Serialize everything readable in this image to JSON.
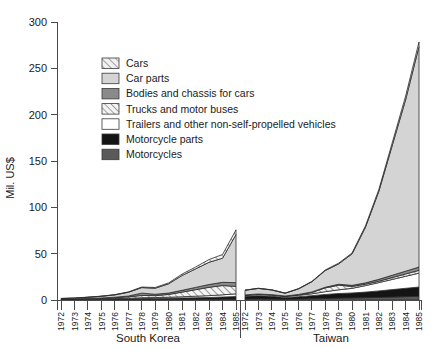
{
  "chart_data": {
    "type": "area",
    "title": "",
    "subtitle": "",
    "xlabel": "",
    "ylabel": "Mil. US$",
    "ylim": [
      0,
      300
    ],
    "yticks": [
      0,
      50,
      100,
      150,
      200,
      250,
      300
    ],
    "ytick_labels": [
      "0",
      "50",
      "100",
      "150",
      "200",
      "250",
      "300"
    ],
    "grid": false,
    "legend_position": "upper-left-inside",
    "stacked": true,
    "panels": [
      {
        "name": "South Korea",
        "label": "South Korea",
        "x": [
          1972,
          1973,
          1974,
          1975,
          1976,
          1977,
          1978,
          1979,
          1980,
          1981,
          1982,
          1983,
          1984,
          1985
        ],
        "xtick_labels": [
          "1972",
          "1973",
          "1974",
          "1975",
          "1976",
          "1977",
          "1978",
          "1979",
          "1980",
          "1981",
          "1982",
          "1983",
          "1984",
          "1985"
        ],
        "series": [
          {
            "name": "Motorcycles",
            "values": [
              0.2,
              0.2,
              0.3,
              0.3,
              0.4,
              0.4,
              0.5,
              0.5,
              0.5,
              0.6,
              0.6,
              0.7,
              0.8,
              0.9
            ]
          },
          {
            "name": "Motorcycle parts",
            "values": [
              0.3,
              0.3,
              0.4,
              0.5,
              0.6,
              0.8,
              1.0,
              1.2,
              1.3,
              1.5,
              1.8,
              2.0,
              2.4,
              2.8
            ]
          },
          {
            "name": "Trailers and other non-self-propelled vehicles",
            "values": [
              0.2,
              0.2,
              0.3,
              0.4,
              0.5,
              0.7,
              0.9,
              1.0,
              1.2,
              1.4,
              1.7,
              2.0,
              2.4,
              3.0
            ]
          },
          {
            "name": "Trucks and motor buses",
            "values": [
              0.2,
              0.3,
              0.4,
              0.6,
              0.9,
              1.5,
              2.5,
              2.0,
              3.0,
              5.0,
              7.0,
              9.0,
              10.0,
              8.0
            ]
          },
          {
            "name": "Bodies and chassis for cars",
            "values": [
              0.2,
              0.2,
              0.3,
              0.4,
              0.6,
              0.9,
              2.5,
              1.5,
              1.5,
              2.0,
              2.5,
              3.0,
              3.5,
              4.0
            ]
          },
          {
            "name": "Car parts",
            "values": [
              0.5,
              0.8,
              1.2,
              1.8,
              2.5,
              4.0,
              6.0,
              6.5,
              10.0,
              16.0,
              20.0,
              24.0,
              26.0,
              52.0
            ]
          },
          {
            "name": "Cars",
            "values": [
              0.1,
              0.1,
              0.2,
              0.2,
              0.3,
              0.4,
              0.6,
              0.8,
              1.0,
              1.5,
              2.0,
              3.0,
              4.0,
              5.0
            ]
          }
        ],
        "totals": [
          1.7,
          2.1,
          3.1,
          4.2,
          5.8,
          8.7,
          14.0,
          13.5,
          18.5,
          28.0,
          35.6,
          43.7,
          49.1,
          75.7
        ],
        "peak": {
          "year": 1985,
          "value": 75.7
        }
      },
      {
        "name": "Taiwan",
        "label": "Taiwan",
        "x": [
          1972,
          1973,
          1974,
          1975,
          1976,
          1977,
          1978,
          1979,
          1980,
          1981,
          1982,
          1983,
          1984,
          1985
        ],
        "xtick_labels": [
          "1972",
          "1973",
          "1974",
          "1975",
          "1976",
          "1977",
          "1978",
          "1979",
          "1980",
          "1981",
          "1982",
          "1983",
          "1984",
          "1985"
        ],
        "series": [
          {
            "name": "Motorcycles",
            "values": [
              1.0,
              1.2,
              1.0,
              0.8,
              1.0,
              1.3,
              1.6,
              2.0,
              2.2,
              2.5,
              2.8,
              3.2,
              3.6,
              4.0
            ]
          },
          {
            "name": "Motorcycle parts",
            "values": [
              3.0,
              3.5,
              3.0,
              2.0,
              2.6,
              3.4,
              4.4,
              5.0,
              5.4,
              6.0,
              7.0,
              8.0,
              9.0,
              10.0
            ]
          },
          {
            "name": "Trailers and other non-self-propelled vehicles",
            "values": [
              1.0,
              1.2,
              1.2,
              1.0,
              1.5,
              2.0,
              3.0,
              4.0,
              5.0,
              7.0,
              9.0,
              11.0,
              13.0,
              15.0
            ]
          },
          {
            "name": "Trucks and motor buses",
            "values": [
              0.3,
              0.4,
              0.4,
              0.3,
              0.6,
              1.5,
              4.0,
              5.0,
              2.0,
              1.5,
              1.5,
              2.0,
              2.5,
              3.0
            ]
          },
          {
            "name": "Bodies and chassis for cars",
            "values": [
              0.2,
              0.2,
              0.2,
              0.2,
              0.3,
              0.5,
              0.8,
              1.0,
              1.2,
              1.5,
              2.0,
              2.5,
              3.0,
              3.5
            ]
          },
          {
            "name": "Car parts",
            "values": [
              5.0,
              6.0,
              5.0,
              3.0,
              6.0,
              11.0,
              18.0,
              22.0,
              34.0,
              60.0,
              95.0,
              140.0,
              185.0,
              238.0
            ]
          },
          {
            "name": "Cars",
            "values": [
              0.2,
              0.2,
              0.2,
              0.2,
              0.3,
              0.4,
              0.6,
              0.8,
              1.0,
              1.5,
              2.0,
              3.0,
              4.0,
              5.0
            ]
          }
        ],
        "totals": [
          10.7,
          12.7,
          11.0,
          7.5,
          12.3,
          20.1,
          32.4,
          39.8,
          50.8,
          80.0,
          119.3,
          169.7,
          220.1,
          278.5
        ],
        "peak": {
          "year": 1985,
          "value": 278.5
        }
      }
    ],
    "legend": [
      {
        "label": "Cars",
        "fill": "#e8e8e8",
        "pattern": "diagonal-hatch-light"
      },
      {
        "label": "Car parts",
        "fill": "#d4d4d4",
        "pattern": "solid"
      },
      {
        "label": "Bodies and chassis for cars",
        "fill": "#8a8a8a",
        "pattern": "solid"
      },
      {
        "label": "Trucks and motor buses",
        "fill": "#ededed",
        "pattern": "diagonal-hatch"
      },
      {
        "label": "Trailers and other non-self-propelled vehicles",
        "fill": "#ffffff",
        "pattern": "solid"
      },
      {
        "label": "Motorcycle parts",
        "fill": "#141414",
        "pattern": "solid"
      },
      {
        "label": "Motorcycles",
        "fill": "#5a5a5a",
        "pattern": "solid"
      }
    ]
  }
}
